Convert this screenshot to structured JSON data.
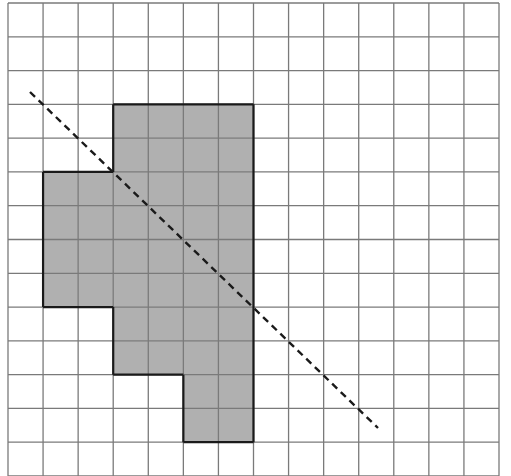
{
  "diagram": {
    "type": "grid-shape-with-symmetry-line",
    "grid": {
      "columns": 14,
      "rows": 14,
      "left": 8,
      "top": 3,
      "right": 499,
      "bottom": 476,
      "line_color": "#7a7a7a"
    },
    "shape": {
      "fill_color": "#b0b0b0",
      "outline_color": "#1a1a1a",
      "filled_cells_by_row": [
        {
          "row": 3,
          "col_start": 3,
          "col_end": 6
        },
        {
          "row": 4,
          "col_start": 3,
          "col_end": 6
        },
        {
          "row": 5,
          "col_start": 1,
          "col_end": 6
        },
        {
          "row": 6,
          "col_start": 1,
          "col_end": 6
        },
        {
          "row": 7,
          "col_start": 1,
          "col_end": 6
        },
        {
          "row": 8,
          "col_start": 1,
          "col_end": 6
        },
        {
          "row": 9,
          "col_start": 3,
          "col_end": 6
        },
        {
          "row": 10,
          "col_start": 3,
          "col_end": 6
        },
        {
          "row": 11,
          "col_start": 5,
          "col_end": 6
        },
        {
          "row": 12,
          "col_start": 5,
          "col_end": 6
        }
      ]
    },
    "dashed_line": {
      "x1": 30,
      "y1": 92,
      "x2": 378,
      "y2": 428,
      "color": "#1a1a1a"
    }
  }
}
